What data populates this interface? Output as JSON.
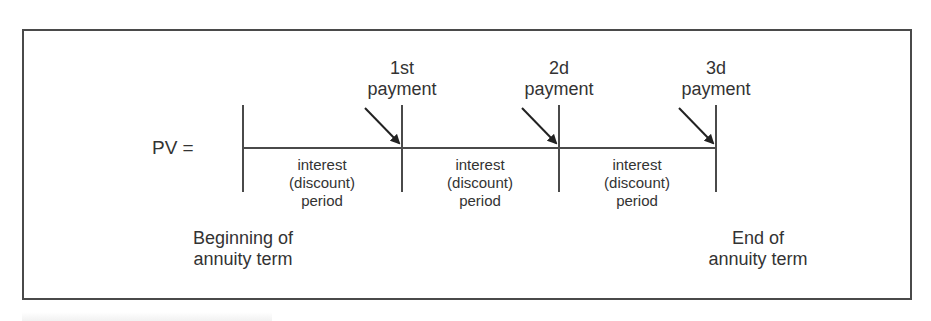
{
  "diagram": {
    "pv_label": "PV =",
    "payments": [
      {
        "line1": "1st",
        "line2": "payment"
      },
      {
        "line1": "2d",
        "line2": "payment"
      },
      {
        "line1": "3d",
        "line2": "payment"
      }
    ],
    "periods": [
      {
        "line1": "interest",
        "line2": "(discount)",
        "line3": "period"
      },
      {
        "line1": "interest",
        "line2": "(discount)",
        "line3": "period"
      },
      {
        "line1": "interest",
        "line2": "(discount)",
        "line3": "period"
      }
    ],
    "start_label": {
      "line1": "Beginning of",
      "line2": "annuity term"
    },
    "end_label": {
      "line1": "End of",
      "line2": "annuity term"
    },
    "colors": {
      "line": "#4a4a4a",
      "text": "#333333"
    }
  }
}
